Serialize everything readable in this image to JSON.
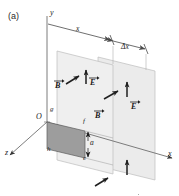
{
  "figure": {
    "panel_label": "(a)",
    "type": "physics-diagram",
    "axes": [
      {
        "name": "y-axis",
        "label": "y"
      },
      {
        "name": "x-axis",
        "label": "x"
      },
      {
        "name": "z-axis",
        "label": "z"
      }
    ],
    "origin_label": "O",
    "dimensions": [
      {
        "name": "x-distance",
        "label": "x"
      },
      {
        "name": "delta-x",
        "label": "Δx"
      },
      {
        "name": "loop-height",
        "label": "a"
      }
    ],
    "loop_vertices": [
      {
        "name": "g",
        "label": "g"
      },
      {
        "name": "h",
        "label": "h"
      },
      {
        "name": "f",
        "label": "f"
      },
      {
        "name": "e",
        "label": "e"
      }
    ],
    "field_vectors": [
      {
        "name": "B-front-upper",
        "label": "B"
      },
      {
        "name": "E-front-upper",
        "label": "E"
      },
      {
        "name": "B-back-upper",
        "label": "B"
      },
      {
        "name": "E-back-upper",
        "label": "E"
      },
      {
        "name": "B-back-lower",
        "label": "B"
      },
      {
        "name": "E-back-lower",
        "label": "E"
      }
    ],
    "colors": {
      "plane_fill": "#e8e8e8",
      "plane_edge": "#b4b4b4",
      "loop_fill": "#9a9a9a",
      "line": "#555555",
      "text": "#1a1a1a"
    }
  }
}
